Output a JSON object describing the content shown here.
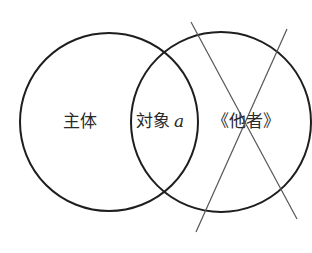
{
  "diagram": {
    "type": "venn",
    "circles": [
      {
        "id": "subject",
        "cx": 109,
        "cy": 122,
        "r": 89
      },
      {
        "id": "other",
        "cx": 221,
        "cy": 122,
        "r": 90
      }
    ],
    "labels": {
      "subject": "主体",
      "object_a_prefix": "対象",
      "object_a_var": "a",
      "other": "《他者》"
    },
    "cross_lines": [
      {
        "x1": 191,
        "y1": 22,
        "x2": 297,
        "y2": 219
      },
      {
        "x1": 287,
        "y1": 29,
        "x2": 196,
        "y2": 232
      }
    ],
    "colors": {
      "circle": "#1e1e1e",
      "cross": "#555555",
      "text": "#2a2a2a"
    }
  }
}
